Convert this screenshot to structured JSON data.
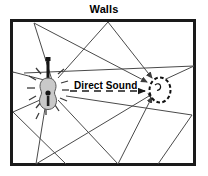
{
  "figure": {
    "title": "Walls",
    "direct_sound_label": "Direct Sound",
    "caption_position": "top-center"
  },
  "colors": {
    "wall": "#1a1a1a",
    "ray": "#4a4a4a",
    "guitar_body": "#c9c9c9",
    "guitar_outline": "#555555",
    "guitar_neck": "#151515",
    "ear_outline": "#111111",
    "background": "#ffffff",
    "text": "#000000"
  },
  "room": {
    "x": 10,
    "y": 19,
    "width": 186,
    "height": 147,
    "border_width": 3
  },
  "source": {
    "name": "guitar",
    "x": 48,
    "y": 88,
    "radiating_dashes": 12
  },
  "listener": {
    "name": "ear",
    "x": 160,
    "y": 90,
    "rx": 11,
    "ry": 13
  },
  "direct_path": {
    "from_x": 62,
    "from_y": 90,
    "to_x": 146,
    "to_y": 90,
    "style": "dashed"
  },
  "reflected_paths": [
    {
      "points": [
        [
          52,
          84
        ],
        [
          34,
          23
        ],
        [
          146,
          82
        ]
      ]
    },
    {
      "points": [
        [
          54,
          86
        ],
        [
          108,
          22
        ],
        [
          151,
          79
        ]
      ]
    },
    {
      "points": [
        [
          56,
          90
        ],
        [
          194,
          66
        ],
        [
          152,
          88
        ]
      ]
    },
    {
      "points": [
        [
          44,
          94
        ],
        [
          12,
          72
        ],
        [
          13,
          73
        ]
      ]
    },
    {
      "points": [
        [
          44,
          96
        ],
        [
          12,
          113
        ],
        [
          13,
          112
        ]
      ]
    },
    {
      "points": [
        [
          56,
          98
        ],
        [
          118,
          163
        ],
        [
          152,
          98
        ]
      ]
    },
    {
      "points": [
        [
          50,
          100
        ],
        [
          36,
          163
        ],
        [
          154,
          94
        ]
      ]
    },
    {
      "points": [
        [
          48,
          102
        ],
        [
          12,
          113
        ],
        [
          64,
          163
        ]
      ]
    },
    {
      "points": [
        [
          60,
          96
        ],
        [
          192,
          115
        ],
        [
          158,
          164
        ]
      ]
    }
  ],
  "elements": {
    "title_name": "figure-title",
    "room_name": "room-walls",
    "source_name": "guitar-sound-source",
    "listener_name": "ear-listener",
    "direct_name": "direct-sound-ray",
    "reflected_name": "reflected-sound-rays"
  }
}
